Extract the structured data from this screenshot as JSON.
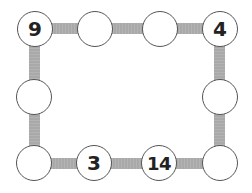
{
  "puzzle": {
    "colors": {
      "bar": "#a9a9a9",
      "node_border": "#555555",
      "node_fill": "#ffffff",
      "text": "#222222"
    },
    "nodes": [
      {
        "id": "top-left",
        "x": 35,
        "y": 29,
        "value": "9"
      },
      {
        "id": "top-2",
        "x": 95,
        "y": 29,
        "value": ""
      },
      {
        "id": "top-3",
        "x": 160,
        "y": 29,
        "value": ""
      },
      {
        "id": "top-right",
        "x": 220,
        "y": 29,
        "value": "4"
      },
      {
        "id": "left-mid",
        "x": 34,
        "y": 97,
        "value": ""
      },
      {
        "id": "right-mid",
        "x": 220,
        "y": 97,
        "value": ""
      },
      {
        "id": "bottom-left",
        "x": 34,
        "y": 163,
        "value": ""
      },
      {
        "id": "bottom-2",
        "x": 94,
        "y": 163,
        "value": "3"
      },
      {
        "id": "bottom-3",
        "x": 159,
        "y": 163,
        "value": "14"
      },
      {
        "id": "bottom-right",
        "x": 220,
        "y": 163,
        "value": ""
      }
    ]
  }
}
